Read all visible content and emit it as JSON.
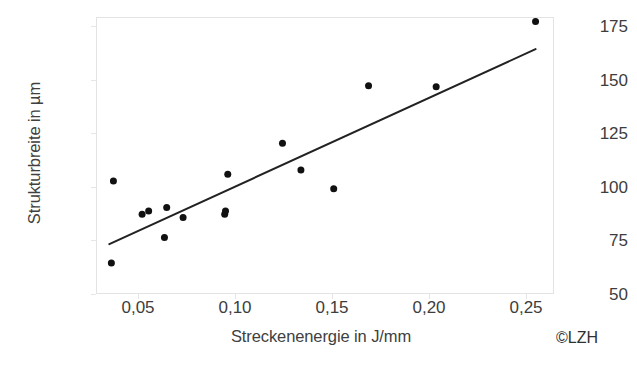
{
  "chart_data": {
    "type": "scatter",
    "title": "",
    "xlabel": "Streckenenergie in J/mm",
    "ylabel": "Strukturbreite in µm",
    "xticklabels": [
      "0,05",
      "0,10",
      "0,15",
      "0,20",
      "0,25"
    ],
    "xtickvalues": [
      0.05,
      0.1,
      0.15,
      0.2,
      0.25
    ],
    "yticklabels": [
      "50",
      "75",
      "100",
      "125",
      "150",
      "175"
    ],
    "ytickvalues": [
      50,
      75,
      100,
      125,
      150,
      175
    ],
    "xlim": [
      0.032,
      0.2555
    ],
    "ylim": [
      50,
      175
    ],
    "grid": false,
    "legend": null,
    "marker": {
      "shape": "circle",
      "color": "#111111",
      "size_px": 7
    },
    "points": [
      {
        "x": 0.0395,
        "y": 64
      },
      {
        "x": 0.0405,
        "y": 101
      },
      {
        "x": 0.0545,
        "y": 86
      },
      {
        "x": 0.0577,
        "y": 87.5
      },
      {
        "x": 0.0654,
        "y": 75.5
      },
      {
        "x": 0.0665,
        "y": 89
      },
      {
        "x": 0.0745,
        "y": 84.5
      },
      {
        "x": 0.0948,
        "y": 86
      },
      {
        "x": 0.0952,
        "y": 87.5
      },
      {
        "x": 0.0963,
        "y": 104
      },
      {
        "x": 0.123,
        "y": 118
      },
      {
        "x": 0.132,
        "y": 106
      },
      {
        "x": 0.148,
        "y": 97.5
      },
      {
        "x": 0.165,
        "y": 144
      },
      {
        "x": 0.198,
        "y": 143.5
      },
      {
        "x": 0.2465,
        "y": 173
      }
    ],
    "trendline": {
      "type": "linear-fit",
      "color": "#222222",
      "width_px": 2,
      "x_start": 0.0385,
      "y_start": 72.5,
      "x_end": 0.2465,
      "y_end": 160.5
    }
  },
  "annotations": {
    "copyright": "©LZH"
  }
}
